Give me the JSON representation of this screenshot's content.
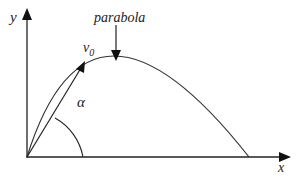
{
  "diagram": {
    "labels": {
      "y_axis": "y",
      "x_axis": "x",
      "curve": "parabola",
      "velocity": "v",
      "velocity_subscript": "0",
      "angle": "α"
    },
    "colors": {
      "stroke": "#222222",
      "background": "#ffffff"
    }
  }
}
